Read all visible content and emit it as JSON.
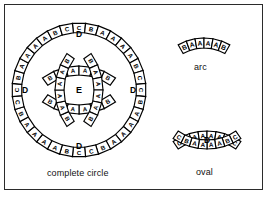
{
  "figure": {
    "background_color": "#ffffff",
    "border_color": "#2b2b2b",
    "tile_fill": "#ffffff",
    "tile_stroke": "#000000",
    "label_color": "#111111"
  },
  "captions": {
    "complete_circle": "complete circle",
    "arc": "arc",
    "oval": "oval"
  },
  "shapes": {
    "complete_circle": {
      "name": "complete circle",
      "center": {
        "x": 79,
        "y": 90
      },
      "outer_radius": 67,
      "region_labels": [
        {
          "text": "E",
          "x": 79,
          "y": 90
        },
        {
          "text": "D",
          "x": 79,
          "y": 34
        },
        {
          "text": "D",
          "x": 79,
          "y": 146
        },
        {
          "text": "D",
          "x": 25,
          "y": 90
        },
        {
          "text": "D",
          "x": 133,
          "y": 90
        }
      ],
      "outer_ring": {
        "description": "outer circle of tiles, 8 tiles per quadrant",
        "quadrant_sequence": [
          "C",
          "B",
          "A",
          "A",
          "A",
          "A",
          "B",
          "C"
        ],
        "total_tiles": 32,
        "letters": [
          "C",
          "B",
          "A",
          "A",
          "A",
          "A",
          "B",
          "C",
          "C",
          "B",
          "A",
          "A",
          "A",
          "A",
          "B",
          "C",
          "C",
          "B",
          "A",
          "A",
          "A",
          "A",
          "B",
          "C",
          "C",
          "B",
          "A",
          "A",
          "A",
          "A",
          "B",
          "C"
        ]
      },
      "inner_arcs": [
        {
          "position": "top",
          "letters": [
            "B",
            "A",
            "A",
            "A",
            "A",
            "B"
          ]
        },
        {
          "position": "bottom",
          "letters": [
            "B",
            "A",
            "A",
            "A",
            "A",
            "B"
          ]
        },
        {
          "position": "left",
          "letters": [
            "B",
            "A",
            "A",
            "A",
            "A",
            "B"
          ]
        },
        {
          "position": "right",
          "letters": [
            "B",
            "A",
            "A",
            "A",
            "A",
            "B"
          ]
        }
      ]
    },
    "arc": {
      "name": "arc",
      "letters": [
        "B",
        "A",
        "A",
        "A",
        "A",
        "B"
      ],
      "tile_count": 6,
      "center": {
        "x": 204,
        "y": 46
      }
    },
    "oval": {
      "name": "oval",
      "center": {
        "x": 207,
        "y": 140
      },
      "region_label": "D",
      "top_letters": [
        "C",
        "B",
        "A",
        "A",
        "A",
        "A",
        "B",
        "C"
      ],
      "bottom_letters": [
        "C",
        "B",
        "A",
        "A",
        "A",
        "A",
        "B",
        "C"
      ],
      "tile_count": 16
    }
  }
}
